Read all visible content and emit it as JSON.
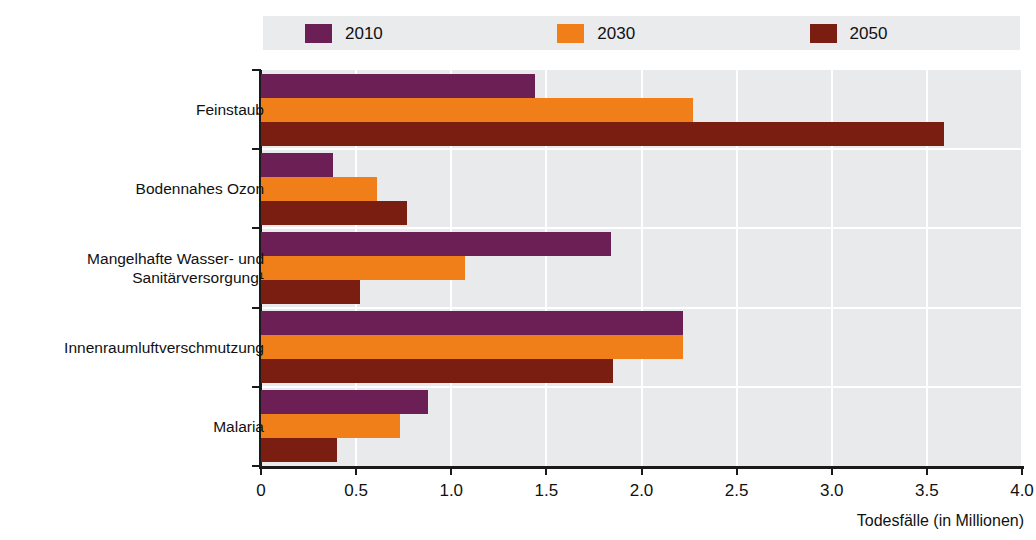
{
  "chart_data": {
    "type": "bar",
    "orientation": "horizontal",
    "title": "",
    "xlabel": "Todesfälle (in Millionen)",
    "ylabel": "",
    "xlim": [
      0,
      4.0
    ],
    "xticks": [
      "0",
      "0.5",
      "1.0",
      "1.5",
      "2.0",
      "2.5",
      "3.0",
      "3.5",
      "4.0"
    ],
    "xtick_values": [
      0,
      0.5,
      1.0,
      1.5,
      2.0,
      2.5,
      3.0,
      3.5,
      4.0
    ],
    "grid": true,
    "legend_position": "top",
    "categories": [
      "Feinstaub",
      "Bodennahes Ozon",
      "Mangelhafte Wasser- und\nSanitärversorgung¹",
      "Innenraumluftverschmutzung",
      "Malaria"
    ],
    "series": [
      {
        "name": "2010",
        "color": "#6B1F55",
        "values": [
          1.44,
          0.38,
          1.84,
          2.22,
          0.88
        ]
      },
      {
        "name": "2030",
        "color": "#F07F1A",
        "values": [
          2.27,
          0.61,
          1.07,
          2.22,
          0.73
        ]
      },
      {
        "name": "2050",
        "color": "#7A1E12",
        "values": [
          3.59,
          0.77,
          0.52,
          1.85,
          0.4
        ]
      }
    ]
  },
  "legend": {
    "items": [
      {
        "label": "2010",
        "color": "#6B1F55"
      },
      {
        "label": "2030",
        "color": "#F07F1A"
      },
      {
        "label": "2050",
        "color": "#7A1E12"
      }
    ]
  },
  "axis": {
    "x_label": "Todesfälle (in Millionen)"
  },
  "colors": {
    "series_2010": "#6B1F55",
    "series_2030": "#F07F1A",
    "series_2050": "#7A1E12",
    "plot_background": "#E8EAEC",
    "legend_background": "#E9EBED",
    "gridline": "#FFFFFF",
    "axis": "#1A1A1A"
  }
}
